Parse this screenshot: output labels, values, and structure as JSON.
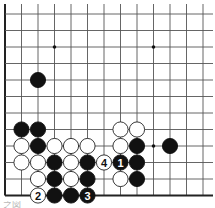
{
  "diagram": {
    "type": "go-board-fragment",
    "grid": {
      "columns": 13,
      "rows": 12,
      "origin_x": 5,
      "origin_y": 14,
      "spacing_x": 16.5,
      "spacing_y": 16.5,
      "left_edge": true,
      "bottom_edge": true,
      "line_color": "#555555",
      "edge_color": "#222222"
    },
    "star_points": [
      {
        "col": 3,
        "row": 2
      },
      {
        "col": 9,
        "row": 2
      },
      {
        "col": 9,
        "row": 8
      }
    ],
    "stones": [
      {
        "col": 2,
        "row": 4,
        "color": "black",
        "label": ""
      },
      {
        "col": 1,
        "row": 7,
        "color": "black",
        "label": ""
      },
      {
        "col": 2,
        "row": 7,
        "color": "black",
        "label": ""
      },
      {
        "col": 7,
        "row": 7,
        "color": "white",
        "label": ""
      },
      {
        "col": 8,
        "row": 7,
        "color": "white",
        "label": ""
      },
      {
        "col": 1,
        "row": 8,
        "color": "white",
        "label": ""
      },
      {
        "col": 2,
        "row": 8,
        "color": "black",
        "label": ""
      },
      {
        "col": 3,
        "row": 8,
        "color": "white",
        "label": ""
      },
      {
        "col": 4,
        "row": 8,
        "color": "white",
        "label": ""
      },
      {
        "col": 5,
        "row": 8,
        "color": "white",
        "label": ""
      },
      {
        "col": 7,
        "row": 8,
        "color": "white",
        "label": ""
      },
      {
        "col": 8,
        "row": 8,
        "color": "black",
        "label": ""
      },
      {
        "col": 10,
        "row": 8,
        "color": "black",
        "label": ""
      },
      {
        "col": 1,
        "row": 9,
        "color": "white",
        "label": ""
      },
      {
        "col": 2,
        "row": 9,
        "color": "white",
        "label": ""
      },
      {
        "col": 3,
        "row": 9,
        "color": "black",
        "label": ""
      },
      {
        "col": 4,
        "row": 9,
        "color": "white",
        "label": ""
      },
      {
        "col": 5,
        "row": 9,
        "color": "black",
        "label": ""
      },
      {
        "col": 6,
        "row": 9,
        "color": "white",
        "label": "4"
      },
      {
        "col": 7,
        "row": 9,
        "color": "black",
        "label": "1"
      },
      {
        "col": 8,
        "row": 9,
        "color": "black",
        "label": ""
      },
      {
        "col": 2,
        "row": 10,
        "color": "white",
        "label": ""
      },
      {
        "col": 3,
        "row": 10,
        "color": "black",
        "label": ""
      },
      {
        "col": 4,
        "row": 10,
        "color": "white",
        "label": ""
      },
      {
        "col": 5,
        "row": 10,
        "color": "black",
        "label": ""
      },
      {
        "col": 7,
        "row": 10,
        "color": "white",
        "label": ""
      },
      {
        "col": 8,
        "row": 10,
        "color": "black",
        "label": ""
      },
      {
        "col": 2,
        "row": 11,
        "color": "white",
        "label": "2"
      },
      {
        "col": 3,
        "row": 11,
        "color": "black",
        "label": ""
      },
      {
        "col": 4,
        "row": 11,
        "color": "black",
        "label": ""
      },
      {
        "col": 5,
        "row": 11,
        "color": "black",
        "label": "3"
      }
    ],
    "colors": {
      "black_stone": "#111111",
      "white_stone": "#ffffff",
      "white_stone_outline": "#222222",
      "background": "#ffffff"
    }
  },
  "caption": {
    "text": "之図"
  }
}
